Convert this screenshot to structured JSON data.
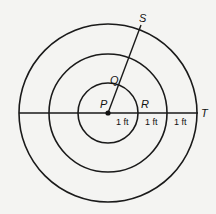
{
  "diagram": {
    "center": {
      "x": 108,
      "y": 113
    },
    "circles": [
      {
        "name": "inner",
        "r": 30
      },
      {
        "name": "middle",
        "r": 59
      },
      {
        "name": "outer",
        "r": 89
      }
    ],
    "points": {
      "P": "P",
      "Q": "Q",
      "R": "R",
      "S": "S",
      "T": "T"
    },
    "segment_labels": [
      "1 ft",
      "1 ft",
      "1 ft"
    ],
    "stroke_color": "#1a1a1a",
    "background": "#f4f4f2"
  }
}
